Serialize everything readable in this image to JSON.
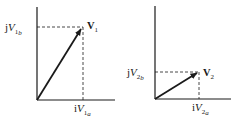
{
  "diagram": {
    "type": "phasor-vector-diagrams",
    "colors": {
      "ink": "#1a1a1a",
      "background": "#ffffff"
    },
    "panels": [
      {
        "id": "v1",
        "vector_label": {
          "main": "V",
          "sub": "1"
        },
        "y_component_label": {
          "prefix": "j",
          "main": "V",
          "sub": "1",
          "subsub": "b"
        },
        "x_component_label": {
          "prefix": "i",
          "main": "V",
          "sub": "1",
          "subsub": "a"
        },
        "components": {
          "a": 0.6,
          "b": 0.8
        }
      },
      {
        "id": "v2",
        "vector_label": {
          "main": "V",
          "sub": "2"
        },
        "y_component_label": {
          "prefix": "j",
          "main": "V",
          "sub": "2",
          "subsub": "b"
        },
        "x_component_label": {
          "prefix": "i",
          "main": "V",
          "sub": "2",
          "subsub": "a"
        },
        "components": {
          "a": 0.58,
          "b": 0.3
        }
      }
    ]
  }
}
